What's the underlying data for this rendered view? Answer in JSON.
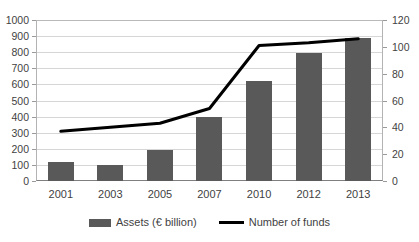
{
  "chart_data": {
    "type": "bar",
    "title": "",
    "xlabel": "",
    "ylabel": "",
    "grid": true,
    "legend_position": "bottom-center",
    "categories": [
      "2001",
      "2003",
      "2005",
      "2007",
      "2010",
      "2012",
      "2013"
    ],
    "series": [
      {
        "name": "Assets (€ billion)",
        "type": "bar",
        "axis": "left",
        "color": "#595959",
        "values": [
          120,
          100,
          195,
          400,
          620,
          795,
          890
        ]
      },
      {
        "name": "Number of funds",
        "type": "line",
        "axis": "right",
        "color": "#000000",
        "values": [
          37,
          40,
          43,
          54,
          101,
          103,
          106
        ]
      }
    ],
    "left_axis": {
      "ylim": [
        0,
        1000
      ],
      "step": 100,
      "ticks": [
        "0",
        "100",
        "200",
        "300",
        "400",
        "500",
        "600",
        "700",
        "800",
        "900",
        "1000"
      ]
    },
    "right_axis": {
      "ylim": [
        0,
        120
      ],
      "step": 20,
      "ticks": [
        "0",
        "20",
        "40",
        "60",
        "80",
        "100",
        "120"
      ]
    }
  },
  "legend": {
    "entries": [
      {
        "label": "Assets (€ billion)",
        "marker": "bar-swatch"
      },
      {
        "label": "Number of funds",
        "marker": "line-swatch"
      }
    ]
  }
}
